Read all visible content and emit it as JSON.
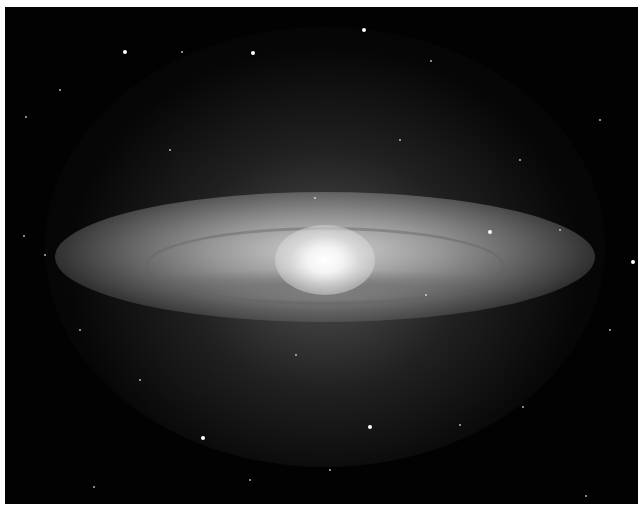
{
  "image": {
    "subject": "edge-on spiral galaxy with bright central bulge and dust ring",
    "colors": {
      "background": "#020202",
      "border": "#ffffff",
      "core": "#ffffff",
      "disk": "#b4b4b4"
    },
    "stars": [
      {
        "x": 125,
        "y": 52,
        "r": 2
      },
      {
        "x": 253,
        "y": 53,
        "r": 2
      },
      {
        "x": 364,
        "y": 30,
        "r": 2
      },
      {
        "x": 182,
        "y": 52,
        "r": 1
      },
      {
        "x": 26,
        "y": 117,
        "r": 1
      },
      {
        "x": 431,
        "y": 61,
        "r": 1
      },
      {
        "x": 490,
        "y": 232,
        "r": 2
      },
      {
        "x": 633,
        "y": 262,
        "r": 2
      },
      {
        "x": 315,
        "y": 198,
        "r": 1
      },
      {
        "x": 426,
        "y": 295,
        "r": 1
      },
      {
        "x": 203,
        "y": 438,
        "r": 2
      },
      {
        "x": 370,
        "y": 427,
        "r": 2
      },
      {
        "x": 460,
        "y": 425,
        "r": 1
      },
      {
        "x": 523,
        "y": 407,
        "r": 1
      },
      {
        "x": 24,
        "y": 236,
        "r": 1
      },
      {
        "x": 45,
        "y": 255,
        "r": 1
      },
      {
        "x": 94,
        "y": 487,
        "r": 1
      },
      {
        "x": 586,
        "y": 496,
        "r": 1
      },
      {
        "x": 296,
        "y": 355,
        "r": 1
      },
      {
        "x": 560,
        "y": 230,
        "r": 1
      },
      {
        "x": 600,
        "y": 120,
        "r": 1
      },
      {
        "x": 80,
        "y": 330,
        "r": 1
      },
      {
        "x": 140,
        "y": 380,
        "r": 1
      },
      {
        "x": 520,
        "y": 160,
        "r": 1
      },
      {
        "x": 60,
        "y": 90,
        "r": 1
      },
      {
        "x": 330,
        "y": 470,
        "r": 1
      },
      {
        "x": 250,
        "y": 480,
        "r": 1
      },
      {
        "x": 610,
        "y": 330,
        "r": 1
      },
      {
        "x": 400,
        "y": 140,
        "r": 1
      },
      {
        "x": 170,
        "y": 150,
        "r": 1
      }
    ]
  }
}
